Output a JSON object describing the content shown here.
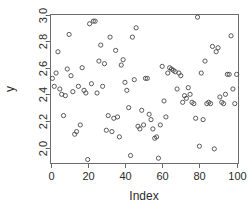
{
  "chart_data": {
    "type": "scatter",
    "title": "",
    "xlabel": "Index",
    "ylabel": "y",
    "xlim": [
      0,
      101
    ],
    "ylim": [
      1.88,
      3.0
    ],
    "grid": false,
    "legend": null,
    "marker": "open-circle",
    "x_ticks": [
      0,
      20,
      40,
      60,
      80,
      100
    ],
    "x_tick_labels": [
      "0",
      "20",
      "40",
      "60",
      "80",
      "100"
    ],
    "y_ticks": [
      2.0,
      2.2,
      2.4,
      2.6,
      2.8,
      3.0
    ],
    "y_tick_labels": [
      "2.0",
      "2.2",
      "2.4",
      "2.6",
      "2.8",
      "3.0"
    ],
    "point_count": 100,
    "x": [
      1,
      2,
      3,
      4,
      5,
      6,
      7,
      8,
      9,
      10,
      11,
      12,
      13,
      14,
      15,
      16,
      17,
      18,
      19,
      20,
      21,
      22,
      23,
      24,
      25,
      26,
      27,
      28,
      29,
      30,
      31,
      32,
      33,
      34,
      35,
      36,
      37,
      38,
      39,
      40,
      41,
      42,
      43,
      44,
      45,
      46,
      47,
      48,
      49,
      50,
      51,
      52,
      53,
      54,
      55,
      56,
      57,
      58,
      59,
      60,
      61,
      62,
      63,
      64,
      65,
      66,
      67,
      68,
      69,
      70,
      71,
      72,
      73,
      74,
      75,
      76,
      77,
      78,
      79,
      80,
      81,
      82,
      83,
      84,
      85,
      86,
      87,
      88,
      89,
      90,
      91,
      92,
      93,
      94,
      95,
      96,
      97,
      98,
      99,
      100
    ],
    "y": [
      2.52,
      2.46,
      2.56,
      2.72,
      2.44,
      2.4,
      2.24,
      2.39,
      2.59,
      2.85,
      2.54,
      2.42,
      2.1,
      2.12,
      2.46,
      2.17,
      2.6,
      2.43,
      2.41,
      1.91,
      2.93,
      2.48,
      2.95,
      2.95,
      2.41,
      2.65,
      2.77,
      2.46,
      2.63,
      2.13,
      2.24,
      2.83,
      2.12,
      2.22,
      2.73,
      2.23,
      2.08,
      2.62,
      2.66,
      2.49,
      2.43,
      2.3,
      1.94,
      2.83,
      2.51,
      2.9,
      2.16,
      2.14,
      2.28,
      2.17,
      2.52,
      2.52,
      2.25,
      2.21,
      2.14,
      2.07,
      2.08,
      1.92,
      2.17,
      2.61,
      2.35,
      2.23,
      2.56,
      2.6,
      2.59,
      2.58,
      2.57,
      2.44,
      2.56,
      2.54,
      2.34,
      2.39,
      2.37,
      2.45,
      2.4,
      2.34,
      2.33,
      2.22,
      2.98,
      2.01,
      2.56,
      2.21,
      2.65,
      2.33,
      2.34,
      2.33,
      2.76,
      1.99,
      2.72,
      2.75,
      2.38,
      2.34,
      2.33,
      2.4,
      2.55,
      2.55,
      2.84,
      2.44,
      2.33,
      2.55
    ]
  },
  "axes": {
    "x_title": "Index",
    "y_title": "y"
  }
}
